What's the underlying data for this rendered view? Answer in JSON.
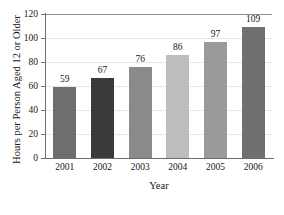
{
  "figure": {
    "cropped_title": "",
    "background_color": "#ffffff"
  },
  "chart_data": {
    "type": "bar",
    "title": "",
    "xlabel": "Year",
    "ylabel": "Hours per Person Aged 12 or Older",
    "categories": [
      "2001",
      "2002",
      "2003",
      "2004",
      "2005",
      "2006"
    ],
    "values": [
      59,
      67,
      76,
      86,
      97,
      109
    ],
    "value_labels": [
      "59",
      "67",
      "76",
      "86",
      "97",
      "109"
    ],
    "bar_colors": [
      "#6e6e6e",
      "#3a3a3a",
      "#8a8a8a",
      "#bdbdbd",
      "#9a9a9a",
      "#707070"
    ],
    "ylim": [
      0,
      120
    ],
    "ytick_values": [
      0,
      20,
      40,
      60,
      80,
      100,
      120
    ],
    "ytick_labels": [
      "0",
      "20",
      "40",
      "60",
      "80",
      "100",
      "120"
    ],
    "grid": true,
    "grid_axis": "y",
    "legend": "none"
  }
}
